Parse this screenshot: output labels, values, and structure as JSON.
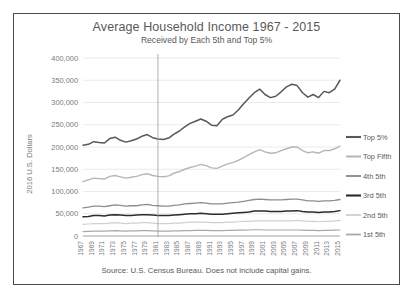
{
  "chart_data": {
    "type": "line",
    "title": "Average Household Income 1967 - 2015",
    "subtitle": "Received by Each 5th and Top 5%",
    "source_note": "Source: U.S. Census Bureau. Does not include capital gains.",
    "xlabel": "",
    "ylabel": "2016 U.S. Dollars",
    "ylim": [
      0,
      400000
    ],
    "ytick_labels": [
      "0",
      "50,000",
      "100,000",
      "150,000",
      "200,000",
      "250,000",
      "300,000",
      "350,000",
      "400,000"
    ],
    "ytick_values": [
      0,
      50000,
      100000,
      150000,
      200000,
      250000,
      300000,
      350000,
      400000
    ],
    "grid": true,
    "legend_position": "right",
    "x": [
      1967,
      1968,
      1969,
      1970,
      1971,
      1972,
      1973,
      1974,
      1975,
      1976,
      1977,
      1978,
      1979,
      1980,
      1981,
      1982,
      1983,
      1984,
      1985,
      1986,
      1987,
      1988,
      1989,
      1990,
      1991,
      1992,
      1993,
      1994,
      1995,
      1996,
      1997,
      1998,
      1999,
      2000,
      2001,
      2002,
      2003,
      2004,
      2005,
      2006,
      2007,
      2008,
      2009,
      2010,
      2011,
      2012,
      2013,
      2014,
      2015
    ],
    "xtick_labels": [
      "1967",
      "1969",
      "1971",
      "1973",
      "1975",
      "1977",
      "1979",
      "1981",
      "1983",
      "1985",
      "1987",
      "1989",
      "1991",
      "1993",
      "1995",
      "1997",
      "1999",
      "2001",
      "2003",
      "2005",
      "2007",
      "2009",
      "2011",
      "2013",
      "2015"
    ],
    "series": [
      {
        "name": "Top 5%",
        "color": "#585858",
        "width": 1.5,
        "values": [
          204000,
          206000,
          212000,
          210000,
          209000,
          219000,
          222000,
          215000,
          211000,
          214000,
          218000,
          224000,
          228000,
          221000,
          218000,
          217000,
          220000,
          229000,
          236000,
          245000,
          253000,
          258000,
          263000,
          258000,
          249000,
          248000,
          262000,
          268000,
          272000,
          283000,
          297000,
          310000,
          322000,
          330000,
          318000,
          311000,
          314000,
          324000,
          335000,
          341000,
          338000,
          322000,
          312000,
          318000,
          311000,
          325000,
          322000,
          330000,
          350000
        ]
      },
      {
        "name": "Top Fifth",
        "color": "#b6b6b6",
        "width": 1.4,
        "values": [
          122000,
          126000,
          130000,
          129000,
          128000,
          134000,
          136000,
          133000,
          130000,
          132000,
          134000,
          138000,
          140000,
          136000,
          134000,
          133000,
          135000,
          141000,
          145000,
          150000,
          154000,
          157000,
          161000,
          158000,
          153000,
          152000,
          157000,
          162000,
          165000,
          170000,
          176000,
          183000,
          189000,
          194000,
          189000,
          186000,
          187000,
          192000,
          196000,
          200000,
          200000,
          192000,
          187000,
          189000,
          186000,
          192000,
          192000,
          196000,
          202000
        ]
      },
      {
        "name": "4th 5th",
        "color": "#8d8d8d",
        "width": 1.3,
        "values": [
          63000,
          65000,
          67000,
          67000,
          66000,
          68000,
          70000,
          69000,
          67000,
          68000,
          68000,
          70000,
          71000,
          69000,
          68000,
          67000,
          67000,
          69000,
          70000,
          72000,
          73000,
          74000,
          75000,
          74000,
          72000,
          72000,
          72000,
          74000,
          75000,
          76000,
          78000,
          80000,
          82000,
          83000,
          82000,
          81000,
          81000,
          81000,
          82000,
          83000,
          83000,
          81000,
          79000,
          79000,
          78000,
          79000,
          79000,
          80000,
          82000
        ]
      },
      {
        "name": "3rd 5th",
        "color": "#2b2b2b",
        "width": 1.5,
        "values": [
          43000,
          44000,
          46000,
          46000,
          45000,
          47000,
          48000,
          47000,
          46000,
          46000,
          47000,
          48000,
          48000,
          47000,
          46000,
          46000,
          46000,
          47000,
          48000,
          49000,
          50000,
          50000,
          51000,
          50000,
          49000,
          49000,
          49000,
          50000,
          51000,
          52000,
          53000,
          54000,
          56000,
          56000,
          56000,
          55000,
          55000,
          55000,
          56000,
          56000,
          57000,
          55000,
          54000,
          54000,
          53000,
          54000,
          54000,
          55000,
          57000
        ]
      },
      {
        "name": "2nd 5th",
        "color": "#d0d0d0",
        "width": 1.2,
        "values": [
          26000,
          27000,
          28000,
          28000,
          28000,
          29000,
          30000,
          29000,
          28000,
          29000,
          29000,
          30000,
          30000,
          29000,
          28000,
          28000,
          28000,
          29000,
          29000,
          30000,
          31000,
          31000,
          31000,
          31000,
          30000,
          30000,
          30000,
          31000,
          31000,
          32000,
          33000,
          33000,
          34000,
          34000,
          34000,
          34000,
          34000,
          34000,
          34000,
          34000,
          35000,
          34000,
          33000,
          33000,
          32000,
          33000,
          33000,
          34000,
          35000
        ]
      },
      {
        "name": "1st 5th",
        "color": "#a9a9a9",
        "width": 1.2,
        "values": [
          10000,
          10500,
          11000,
          11000,
          11000,
          11500,
          12000,
          11500,
          11000,
          11500,
          11500,
          12000,
          12000,
          11500,
          11000,
          11000,
          11000,
          11500,
          11500,
          12000,
          12000,
          12500,
          12500,
          12500,
          12000,
          12000,
          12000,
          12500,
          12500,
          13000,
          13000,
          13500,
          14000,
          14000,
          13500,
          13500,
          13500,
          13500,
          13500,
          13500,
          13500,
          13000,
          12500,
          12500,
          12000,
          12500,
          12500,
          13000,
          13500
        ]
      }
    ]
  }
}
